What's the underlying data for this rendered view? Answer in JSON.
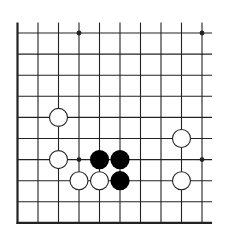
{
  "diagram": {
    "type": "go-board-partial",
    "view": "bottom-left corner region",
    "columns": 10,
    "rows": 10,
    "colors": {
      "background": "#ffffff",
      "line": "#222222",
      "black_stone": "#000000",
      "white_stone_fill": "#ffffff",
      "white_stone_stroke": "#222222"
    },
    "star_points": [
      {
        "col": 4,
        "row": 1
      },
      {
        "col": 10,
        "row": 1
      },
      {
        "col": 4,
        "row": 7
      },
      {
        "col": 10,
        "row": 7
      }
    ],
    "stones": [
      {
        "color": "white",
        "col": 3,
        "row": 5
      },
      {
        "color": "white",
        "col": 9,
        "row": 6
      },
      {
        "color": "white",
        "col": 3,
        "row": 7
      },
      {
        "color": "black",
        "col": 5,
        "row": 7
      },
      {
        "color": "black",
        "col": 6,
        "row": 7
      },
      {
        "color": "white",
        "col": 4,
        "row": 8
      },
      {
        "color": "white",
        "col": 5,
        "row": 8
      },
      {
        "color": "black",
        "col": 6,
        "row": 8
      },
      {
        "color": "white",
        "col": 9,
        "row": 8
      }
    ]
  }
}
